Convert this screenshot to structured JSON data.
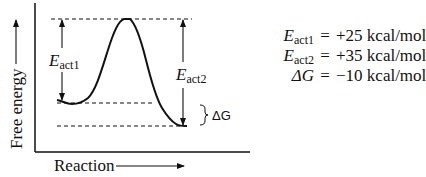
{
  "diagram": {
    "type": "reaction-energy-profile",
    "y_axis_label": "Free energy",
    "x_axis_label": "Reaction",
    "barrier_labels": {
      "eact1": {
        "symbol": "E",
        "subscript": "act1"
      },
      "eact2": {
        "symbol": "E",
        "subscript": "act2"
      },
      "delta_g": "ΔG"
    },
    "equations": [
      {
        "symbol": "E",
        "subscript": "act1",
        "operator": "=",
        "value": "+25 kcal/mol"
      },
      {
        "symbol": "E",
        "subscript": "act2",
        "operator": "=",
        "value": "+35 kcal/mol"
      },
      {
        "symbol": "ΔG",
        "subscript": "",
        "operator": "=",
        "value": "−10 kcal/mol"
      }
    ],
    "levels": {
      "reactant_energy": 0,
      "transition_state_energy": 25,
      "product_energy": -10,
      "units": "kcal/mol"
    },
    "colors": {
      "line": "#111111",
      "background": "#ffffff"
    }
  }
}
